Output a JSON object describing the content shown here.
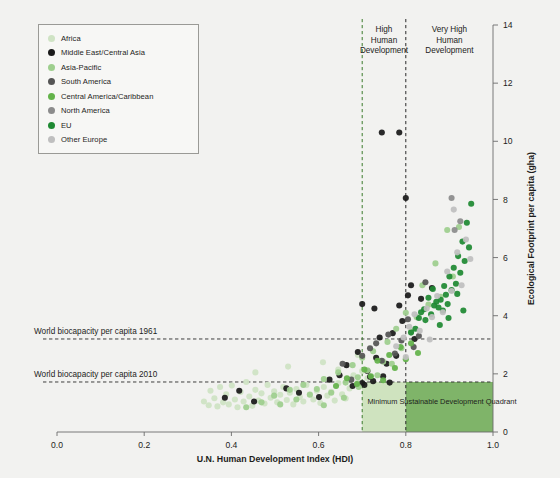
{
  "chart_data": {
    "type": "scatter",
    "title": "",
    "xlabel": "U.N. Human Development Index (HDI)",
    "ylabel": "Ecological Footprint per capita (gha)",
    "xlim": [
      0.0,
      1.0
    ],
    "ylim": [
      0,
      14
    ],
    "xticks": [
      "0.0",
      "0.2",
      "0.4",
      "0.6",
      "0.8",
      "1.0"
    ],
    "xtick_values": [
      0.0,
      0.2,
      0.4,
      0.6,
      0.8,
      1.0
    ],
    "yticks": [
      "0",
      "2",
      "4",
      "6",
      "8",
      "10",
      "12",
      "14"
    ],
    "ytick_values": [
      0,
      2,
      4,
      6,
      8,
      10,
      12,
      14
    ],
    "grid": false,
    "legend_position": "top-left",
    "legend": [
      {
        "name": "Africa",
        "color": "#cfe3c4"
      },
      {
        "name": "Middle East/Central Asia",
        "color": "#1a1a1a"
      },
      {
        "name": "Asia-Pacific",
        "color": "#9ecf8e"
      },
      {
        "name": "South America",
        "color": "#555555"
      },
      {
        "name": "Central America/Caribbean",
        "color": "#63b34a"
      },
      {
        "name": "North America",
        "color": "#8c8c8c"
      },
      {
        "name": "EU",
        "color": "#1f8a33"
      },
      {
        "name": "Other Europe",
        "color": "#bfbfbf"
      }
    ],
    "reference_lines": {
      "horizontal": [
        {
          "label": "World biocapacity per capita 1961",
          "value": 3.2,
          "style": "dashed",
          "color": "#2a2a2a"
        },
        {
          "label": "World biocapacity per capita 2010",
          "value": 1.72,
          "style": "dashed",
          "color": "#2a2a2a"
        }
      ],
      "vertical": [
        {
          "label": "High Human Development",
          "value": 0.7,
          "style": "dashed",
          "color": "#3a7a2a"
        },
        {
          "label": "Very High Human Development",
          "value": 0.8,
          "style": "dashed",
          "color": "#2a2a2a"
        }
      ]
    },
    "annotations": [
      {
        "text": "High Human Development",
        "x": 0.75,
        "y": 13.2
      },
      {
        "text": "Very High Human Development",
        "x": 0.9,
        "y": 13.2
      },
      {
        "text": "Minimum Sustainable Development Quadrant",
        "x": 0.855,
        "y": 0.95
      }
    ],
    "shaded_regions": [
      {
        "label": "Minimum Sustainable Development Quadrant light",
        "x0": 0.7,
        "x1": 0.8,
        "y0": 0,
        "y1": 1.72,
        "color": "#cfe3bf"
      },
      {
        "label": "Minimum Sustainable Development Quadrant dark",
        "x0": 0.8,
        "x1": 1.0,
        "y0": 0,
        "y1": 1.72,
        "color": "#7fb469"
      }
    ],
    "series": [
      {
        "name": "Africa",
        "color": "#cfe3c4",
        "points": [
          [
            0.337,
            1.05
          ],
          [
            0.348,
            0.92
          ],
          [
            0.352,
            1.42
          ],
          [
            0.361,
            1.16
          ],
          [
            0.368,
            0.88
          ],
          [
            0.374,
            1.55
          ],
          [
            0.381,
            1.02
          ],
          [
            0.388,
            1.3
          ],
          [
            0.394,
            0.95
          ],
          [
            0.401,
            1.6
          ],
          [
            0.408,
            1.12
          ],
          [
            0.414,
            0.85
          ],
          [
            0.421,
            1.38
          ],
          [
            0.428,
            1.05
          ],
          [
            0.434,
            1.72
          ],
          [
            0.441,
            1.22
          ],
          [
            0.448,
            0.9
          ],
          [
            0.455,
            1.45
          ],
          [
            0.462,
            1.08
          ],
          [
            0.469,
            1.33
          ],
          [
            0.476,
            0.98
          ],
          [
            0.483,
            1.62
          ],
          [
            0.49,
            1.18
          ],
          [
            0.498,
            1.4
          ],
          [
            0.505,
            1.02
          ],
          [
            0.512,
            1.28
          ],
          [
            0.519,
            1.55
          ],
          [
            0.527,
            1.1
          ],
          [
            0.534,
            1.35
          ],
          [
            0.542,
            0.95
          ],
          [
            0.549,
            1.48
          ],
          [
            0.557,
            1.2
          ],
          [
            0.565,
            1.05
          ],
          [
            0.572,
            1.62
          ],
          [
            0.58,
            1.3
          ],
          [
            0.588,
            1.12
          ],
          [
            0.596,
            1.42
          ],
          [
            0.604,
            1.0
          ],
          [
            0.612,
            1.55
          ],
          [
            0.62,
            1.25
          ],
          [
            0.629,
            1.38
          ],
          [
            0.637,
            1.08
          ],
          [
            0.645,
            1.68
          ],
          [
            0.654,
            1.3
          ],
          [
            0.662,
            1.15
          ],
          [
            0.671,
            1.5
          ],
          [
            0.68,
            1.95
          ],
          [
            0.69,
            1.7
          ],
          [
            0.7,
            2.1
          ],
          [
            0.712,
            1.85
          ],
          [
            0.455,
            2.05
          ],
          [
            0.53,
            2.25
          ],
          [
            0.61,
            2.4
          ],
          [
            0.645,
            2.15
          ],
          [
            0.69,
            2.65
          ]
        ]
      },
      {
        "name": "Middle East/Central Asia",
        "color": "#1a1a1a",
        "points": [
          [
            0.452,
            1.05
          ],
          [
            0.526,
            1.5
          ],
          [
            0.555,
            1.35
          ],
          [
            0.601,
            1.2
          ],
          [
            0.625,
            1.8
          ],
          [
            0.648,
            1.95
          ],
          [
            0.664,
            2.3
          ],
          [
            0.678,
            1.58
          ],
          [
            0.69,
            2.75
          ],
          [
            0.7,
            1.68
          ],
          [
            0.705,
            1.62
          ],
          [
            0.712,
            2.1
          ],
          [
            0.718,
            1.9
          ],
          [
            0.725,
            1.75
          ],
          [
            0.732,
            2.55
          ],
          [
            0.74,
            3.25
          ],
          [
            0.748,
            1.92
          ],
          [
            0.756,
            2.35
          ],
          [
            0.763,
            1.7
          ],
          [
            0.77,
            3.4
          ],
          [
            0.778,
            2.62
          ],
          [
            0.785,
            4.35
          ],
          [
            0.792,
            3.82
          ],
          [
            0.7,
            4.4
          ],
          [
            0.728,
            4.25
          ],
          [
            0.745,
            10.3
          ],
          [
            0.785,
            10.3
          ],
          [
            0.8,
            8.05
          ],
          [
            0.805,
            4.7
          ],
          [
            0.812,
            5.05
          ],
          [
            0.82,
            3.2
          ],
          [
            0.835,
            4.58
          ],
          [
            0.86,
            4.95
          ],
          [
            0.385,
            1.18
          ],
          [
            0.418,
            1.42
          ]
        ]
      },
      {
        "name": "Asia-Pacific",
        "color": "#9ecf8e",
        "points": [
          [
            0.434,
            0.85
          ],
          [
            0.469,
            1.02
          ],
          [
            0.498,
            1.25
          ],
          [
            0.512,
            0.95
          ],
          [
            0.534,
            1.45
          ],
          [
            0.549,
            1.12
          ],
          [
            0.565,
            1.62
          ],
          [
            0.58,
            1.28
          ],
          [
            0.596,
            1.48
          ],
          [
            0.612,
            1.82
          ],
          [
            0.629,
            1.35
          ],
          [
            0.645,
            2.05
          ],
          [
            0.662,
            1.7
          ],
          [
            0.678,
            2.3
          ],
          [
            0.69,
            1.88
          ],
          [
            0.7,
            2.55
          ],
          [
            0.712,
            2.12
          ],
          [
            0.725,
            2.78
          ],
          [
            0.735,
            1.95
          ],
          [
            0.748,
            2.42
          ],
          [
            0.758,
            3.1
          ],
          [
            0.768,
            2.35
          ],
          [
            0.778,
            3.55
          ],
          [
            0.79,
            2.88
          ],
          [
            0.8,
            4.1
          ],
          [
            0.812,
            3.45
          ],
          [
            0.825,
            3.95
          ],
          [
            0.838,
            5.05
          ],
          [
            0.852,
            4.38
          ],
          [
            0.868,
            5.8
          ],
          [
            0.88,
            4.65
          ],
          [
            0.895,
            6.95
          ],
          [
            0.908,
            5.35
          ],
          [
            0.922,
            7.05
          ],
          [
            0.612,
            0.92
          ],
          [
            0.658,
            1.18
          ],
          [
            0.692,
            1.55
          ]
        ]
      },
      {
        "name": "South America",
        "color": "#555555",
        "points": [
          [
            0.655,
            2.35
          ],
          [
            0.675,
            1.8
          ],
          [
            0.7,
            2.62
          ],
          [
            0.718,
            2.88
          ],
          [
            0.732,
            3.05
          ],
          [
            0.745,
            2.45
          ],
          [
            0.76,
            3.35
          ],
          [
            0.775,
            2.7
          ],
          [
            0.79,
            3.15
          ],
          [
            0.805,
            3.88
          ],
          [
            0.818,
            2.92
          ],
          [
            0.83,
            3.3
          ],
          [
            0.845,
            5.15
          ]
        ]
      },
      {
        "name": "Central America/Caribbean",
        "color": "#63b34a",
        "points": [
          [
            0.64,
            1.58
          ],
          [
            0.665,
            1.85
          ],
          [
            0.688,
            1.65
          ],
          [
            0.705,
            2.15
          ],
          [
            0.72,
            1.92
          ],
          [
            0.735,
            2.45
          ],
          [
            0.748,
            1.78
          ],
          [
            0.762,
            2.65
          ],
          [
            0.775,
            2.2
          ],
          [
            0.788,
            2.92
          ],
          [
            0.8,
            2.5
          ],
          [
            0.812,
            3.05
          ],
          [
            0.828,
            2.72
          ]
        ]
      },
      {
        "name": "North America",
        "color": "#8c8c8c",
        "points": [
          [
            0.905,
            8.05
          ],
          [
            0.912,
            6.95
          ],
          [
            0.925,
            7.25
          ]
        ]
      },
      {
        "name": "EU",
        "color": "#1f8a33",
        "points": [
          [
            0.822,
            3.55
          ],
          [
            0.835,
            4.12
          ],
          [
            0.845,
            3.85
          ],
          [
            0.852,
            4.62
          ],
          [
            0.858,
            4.05
          ],
          [
            0.865,
            4.35
          ],
          [
            0.87,
            4.48
          ],
          [
            0.875,
            4.28
          ],
          [
            0.88,
            4.55
          ],
          [
            0.885,
            4.18
          ],
          [
            0.888,
            5.02
          ],
          [
            0.892,
            4.72
          ],
          [
            0.896,
            4.4
          ],
          [
            0.9,
            5.35
          ],
          [
            0.905,
            4.88
          ],
          [
            0.91,
            5.65
          ],
          [
            0.915,
            5.1
          ],
          [
            0.92,
            6.05
          ],
          [
            0.925,
            5.48
          ],
          [
            0.93,
            6.55
          ],
          [
            0.935,
            5.88
          ],
          [
            0.94,
            7.2
          ],
          [
            0.945,
            6.35
          ],
          [
            0.95,
            7.85
          ],
          [
            0.812,
            3.42
          ],
          [
            0.83,
            3.92
          ],
          [
            0.842,
            4.22
          ],
          [
            0.862,
            4.92
          ],
          [
            0.878,
            3.68
          ],
          [
            0.898,
            3.92
          ],
          [
            0.918,
            4.75
          ],
          [
            0.932,
            4.18
          ]
        ]
      },
      {
        "name": "Other Europe",
        "color": "#bfbfbf",
        "points": [
          [
            0.778,
            2.95
          ],
          [
            0.795,
            3.25
          ],
          [
            0.808,
            3.62
          ],
          [
            0.82,
            4.05
          ],
          [
            0.832,
            3.48
          ],
          [
            0.848,
            4.25
          ],
          [
            0.86,
            3.95
          ],
          [
            0.872,
            4.68
          ],
          [
            0.885,
            4.12
          ],
          [
            0.895,
            5.52
          ],
          [
            0.905,
            4.85
          ],
          [
            0.918,
            6.18
          ],
          [
            0.928,
            5.05
          ],
          [
            0.938,
            6.62
          ],
          [
            0.948,
            5.95
          ],
          [
            0.8,
            2.58
          ],
          [
            0.855,
            3.18
          ],
          [
            0.91,
            7.65
          ]
        ]
      }
    ]
  },
  "axes": {
    "x_title": "U.N. Human Development Index (HDI)",
    "y_title": "Ecological Footprint per capita (gha)"
  }
}
